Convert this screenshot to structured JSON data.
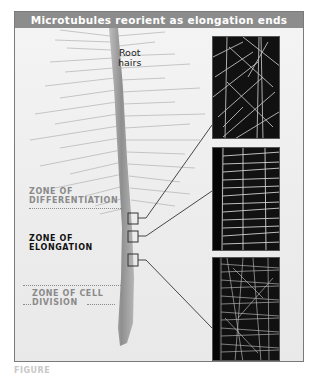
{
  "figure": {
    "title": "Microtubules reorient as elongation ends",
    "root_hairs_label": [
      "Root",
      "hairs"
    ],
    "zones": [
      {
        "lines": [
          "ZONE OF",
          "DIFFERENTIATION"
        ],
        "style": "gray"
      },
      {
        "lines": [
          "ZONE OF",
          "ELONGATION"
        ],
        "style": "black"
      },
      {
        "lines": [
          "ZONE OF CELL",
          "DIVISION"
        ],
        "style": "gray"
      }
    ],
    "micrographs": [
      {
        "name": "micrograph-differentiation",
        "pattern": "longitudinal-oblique microtubules"
      },
      {
        "name": "micrograph-elongation",
        "pattern": "transverse microtubules"
      },
      {
        "name": "micrograph-cell-division",
        "pattern": "dense mixed microtubules"
      }
    ],
    "caption_partial": "FIGURE"
  },
  "colors": {
    "header_bg": "#8c8c8c",
    "header_text": "#ffffff",
    "panel_bg": "#efefef",
    "micrograph_bg": "#111111",
    "label_gray": "#8a8a8a",
    "label_black": "#111111"
  }
}
